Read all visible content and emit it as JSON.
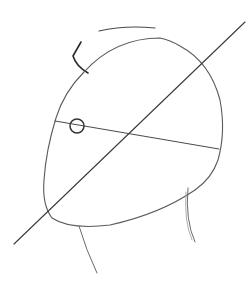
{
  "drawing": {
    "subject": "head construction sketch",
    "medium": "pencil",
    "colors": {
      "background": "#ffffff",
      "main_line": "#3a3a3a",
      "light_line": "#8a8a8a",
      "dark_mark": "#2a2a2a"
    }
  }
}
